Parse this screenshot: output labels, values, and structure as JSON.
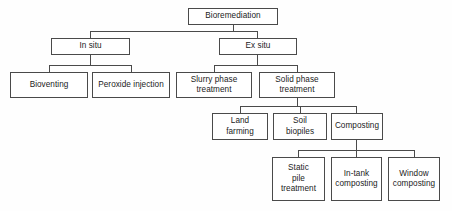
{
  "diagram": {
    "type": "hierarchy-tree",
    "line_color": "#4a4a4a",
    "box_fill": "#ffffff",
    "background": "#fefefe",
    "nodes": {
      "root": {
        "label": "Bioremediation",
        "level": 1
      },
      "in_situ": {
        "label": "In situ",
        "level": 2
      },
      "ex_situ": {
        "label": "Ex situ",
        "level": 2
      },
      "bioventing": {
        "label": "Bioventing",
        "level": 3
      },
      "peroxide_injection": {
        "label": "Peroxide injection",
        "level": 3
      },
      "slurry_phase": {
        "label": "Slurry phase\ntreatment",
        "level": 3
      },
      "solid_phase": {
        "label": "Solid phase\ntreatment",
        "level": 3
      },
      "land_farming": {
        "label": "Land\nfarming",
        "level": 4
      },
      "soil_biopiles": {
        "label": "Soil\nbiopiles",
        "level": 4
      },
      "composting": {
        "label": "Composting",
        "level": 4
      },
      "static_pile": {
        "label": "Static\npile\ntreatment",
        "level": 5
      },
      "in_tank": {
        "label": "In-tank\ncomposting",
        "level": 5
      },
      "window": {
        "label": "Window\ncomposting",
        "level": 5
      }
    },
    "edges": [
      {
        "from": "root",
        "to": "in_situ"
      },
      {
        "from": "root",
        "to": "ex_situ"
      },
      {
        "from": "in_situ",
        "to": "bioventing"
      },
      {
        "from": "in_situ",
        "to": "peroxide_injection"
      },
      {
        "from": "ex_situ",
        "to": "slurry_phase"
      },
      {
        "from": "ex_situ",
        "to": "solid_phase"
      },
      {
        "from": "solid_phase",
        "to": "land_farming"
      },
      {
        "from": "solid_phase",
        "to": "soil_biopiles"
      },
      {
        "from": "solid_phase",
        "to": "composting"
      },
      {
        "from": "composting",
        "to": "static_pile"
      },
      {
        "from": "composting",
        "to": "in_tank"
      },
      {
        "from": "composting",
        "to": "window"
      }
    ]
  }
}
